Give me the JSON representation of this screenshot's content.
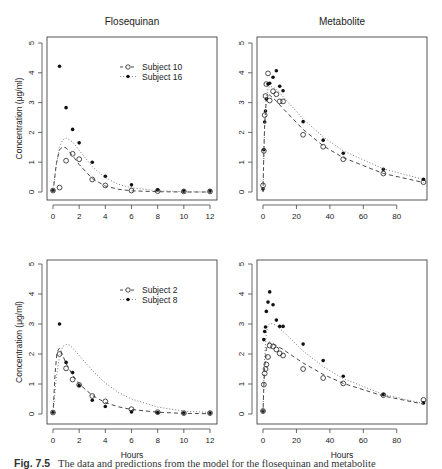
{
  "caption": {
    "label": "Fig. 7.5",
    "text": "The data and predictions from the model for the flosequinan and metabolite"
  },
  "chart_data": [
    {
      "type": "scatter",
      "panel": "top-left",
      "title": "Flosequinan",
      "xlabel": "",
      "ylabel": "Concentration (μg/ml)",
      "xlim": [
        0,
        12
      ],
      "ylim": [
        0,
        5
      ],
      "xticks": [
        0,
        2,
        4,
        6,
        8,
        10,
        12
      ],
      "yticks": [
        0,
        1,
        2,
        3,
        4,
        5
      ],
      "legend": {
        "position": "top-right",
        "entries": [
          {
            "label": "Subject 10",
            "marker": "open-circle",
            "line": "dashed"
          },
          {
            "label": "Subject 16",
            "marker": "filled-dot",
            "line": "dotted"
          }
        ]
      },
      "series": [
        {
          "name": "Subject 10",
          "marker": "open-circle",
          "x": [
            0,
            0.5,
            1,
            1.5,
            2,
            3,
            4,
            6,
            8,
            10,
            12
          ],
          "y": [
            0.05,
            0.15,
            1.05,
            1.28,
            1.1,
            0.42,
            0.22,
            0.05,
            0.03,
            0.02,
            0.02
          ]
        },
        {
          "name": "Subject 16",
          "marker": "filled-dot",
          "x": [
            0,
            0.5,
            1,
            1.5,
            2,
            3,
            4,
            6,
            8,
            10,
            12
          ],
          "y": [
            0.05,
            4.22,
            2.83,
            2.1,
            1.65,
            1.0,
            0.53,
            0.24,
            0.07,
            0.03,
            0.03
          ]
        },
        {
          "name": "Subject 10 fit",
          "line": "dashed",
          "x": [
            0,
            0.25,
            0.5,
            0.75,
            1,
            1.5,
            2,
            3,
            4,
            5,
            6,
            8,
            10,
            12
          ],
          "y": [
            0,
            0.95,
            1.42,
            1.52,
            1.48,
            1.22,
            0.92,
            0.45,
            0.2,
            0.09,
            0.04,
            0.01,
            0.0,
            0.0
          ]
        },
        {
          "name": "Subject 16 fit",
          "line": "dotted",
          "x": [
            0,
            0.25,
            0.5,
            0.75,
            1,
            1.5,
            2,
            3,
            4,
            5,
            6,
            8,
            10,
            12
          ],
          "y": [
            0,
            0.9,
            1.5,
            1.75,
            1.82,
            1.68,
            1.4,
            0.85,
            0.48,
            0.26,
            0.14,
            0.04,
            0.01,
            0.0
          ]
        }
      ]
    },
    {
      "type": "scatter",
      "panel": "top-right",
      "title": "Metabolite",
      "xlabel": "",
      "ylabel": "",
      "xlim": [
        0,
        96
      ],
      "ylim": [
        0,
        5
      ],
      "xticks": [
        0,
        20,
        40,
        60,
        80
      ],
      "yticks": [
        0,
        1,
        2,
        3,
        4,
        5
      ],
      "series": [
        {
          "name": "Subject 10",
          "marker": "open-circle",
          "x": [
            0,
            0.5,
            1,
            1.5,
            2,
            3,
            4,
            6,
            8,
            10,
            12,
            24,
            36,
            48,
            72,
            96
          ],
          "y": [
            0.22,
            1.38,
            2.58,
            3.22,
            3.62,
            3.98,
            3.07,
            3.38,
            3.28,
            3.04,
            3.04,
            1.92,
            1.52,
            1.1,
            0.62,
            0.33
          ]
        },
        {
          "name": "Subject 16",
          "marker": "filled-dot",
          "x": [
            0,
            0.5,
            1,
            1.5,
            2,
            3,
            4,
            6,
            8,
            10,
            12,
            24,
            36,
            48,
            72,
            96
          ],
          "y": [
            0.1,
            1.42,
            2.35,
            2.72,
            3.12,
            3.62,
            3.65,
            3.85,
            4.07,
            3.55,
            3.4,
            2.36,
            1.74,
            1.3,
            0.76,
            0.43
          ]
        },
        {
          "name": "Subject 10 fit",
          "line": "dashed",
          "x": [
            0,
            0.5,
            1,
            2,
            3,
            4,
            6,
            8,
            12,
            24,
            36,
            48,
            72,
            96
          ],
          "y": [
            0,
            1.3,
            2.3,
            3.1,
            3.25,
            3.25,
            3.15,
            3.05,
            2.8,
            2.1,
            1.55,
            1.15,
            0.62,
            0.32
          ]
        },
        {
          "name": "Subject 16 fit",
          "line": "dotted",
          "x": [
            0,
            0.5,
            1,
            2,
            3,
            4,
            6,
            8,
            12,
            24,
            36,
            48,
            72,
            96
          ],
          "y": [
            0,
            1.25,
            2.2,
            3.15,
            3.45,
            3.55,
            3.52,
            3.45,
            3.2,
            2.45,
            1.85,
            1.38,
            0.78,
            0.42
          ]
        }
      ]
    },
    {
      "type": "scatter",
      "panel": "bottom-left",
      "title": "",
      "xlabel": "Hours",
      "ylabel": "Concentration (μg/ml)",
      "xlim": [
        0,
        12
      ],
      "ylim": [
        0,
        5
      ],
      "xticks": [
        0,
        2,
        4,
        6,
        8,
        10,
        12
      ],
      "yticks": [
        0,
        1,
        2,
        3,
        4,
        5
      ],
      "legend": {
        "position": "top-right",
        "entries": [
          {
            "label": "Subject 2",
            "marker": "open-circle",
            "line": "dashed"
          },
          {
            "label": "Subject 8",
            "marker": "filled-dot",
            "line": "dotted"
          }
        ]
      },
      "series": [
        {
          "name": "Subject 2",
          "marker": "open-circle",
          "x": [
            0,
            0.5,
            1,
            1.5,
            2,
            3,
            4,
            6,
            8,
            10,
            12
          ],
          "y": [
            0.05,
            2.0,
            1.52,
            1.15,
            0.97,
            0.6,
            0.42,
            0.16,
            0.06,
            0.03,
            0.03
          ]
        },
        {
          "name": "Subject 8",
          "marker": "filled-dot",
          "x": [
            0,
            0.5,
            1,
            1.5,
            2,
            3,
            4,
            6,
            8,
            10,
            12
          ],
          "y": [
            0.05,
            3.0,
            1.72,
            1.38,
            0.95,
            0.46,
            0.25,
            0.07,
            0.05,
            0.03,
            0.03
          ]
        },
        {
          "name": "Subject 2 fit",
          "line": "dashed",
          "x": [
            0,
            0.15,
            0.3,
            0.5,
            0.75,
            1,
            1.5,
            2,
            3,
            4,
            5,
            6,
            8,
            10,
            12
          ],
          "y": [
            0,
            1.3,
            2.05,
            2.2,
            1.95,
            1.68,
            1.3,
            1.0,
            0.62,
            0.38,
            0.24,
            0.15,
            0.06,
            0.02,
            0.01
          ]
        },
        {
          "name": "Subject 8 fit",
          "line": "dotted",
          "x": [
            0,
            0.25,
            0.5,
            0.75,
            1,
            1.25,
            1.5,
            2,
            3,
            4,
            5,
            6,
            8,
            10,
            12
          ],
          "y": [
            0,
            1.2,
            1.95,
            2.25,
            2.32,
            2.3,
            2.2,
            1.95,
            1.45,
            1.03,
            0.72,
            0.5,
            0.23,
            0.1,
            0.05
          ]
        }
      ]
    },
    {
      "type": "scatter",
      "panel": "bottom-right",
      "title": "",
      "xlabel": "Hours",
      "ylabel": "",
      "xlim": [
        0,
        96
      ],
      "ylim": [
        0,
        5
      ],
      "xticks": [
        0,
        20,
        40,
        60,
        80
      ],
      "yticks": [
        0,
        1,
        2,
        3,
        4,
        5
      ],
      "series": [
        {
          "name": "Subject 2",
          "marker": "open-circle",
          "x": [
            0,
            0.5,
            1,
            1.5,
            2,
            3,
            4,
            6,
            8,
            10,
            12,
            24,
            36,
            48,
            72,
            96
          ],
          "y": [
            0.1,
            0.98,
            1.35,
            1.5,
            1.65,
            1.9,
            2.28,
            2.25,
            2.15,
            2.02,
            1.95,
            1.5,
            1.2,
            1.02,
            0.63,
            0.47
          ]
        },
        {
          "name": "Subject 8",
          "marker": "filled-dot",
          "x": [
            0,
            0.5,
            1,
            1.5,
            2,
            3,
            4,
            6,
            8,
            10,
            12,
            24,
            36,
            48,
            72,
            96
          ],
          "y": [
            0.1,
            2.48,
            2.75,
            2.9,
            3.42,
            3.73,
            4.07,
            3.64,
            3.13,
            2.92,
            2.92,
            2.33,
            1.78,
            1.26,
            0.65,
            0.37
          ]
        },
        {
          "name": "Subject 2 fit",
          "line": "dashed",
          "x": [
            0,
            0.5,
            1,
            2,
            3,
            4,
            6,
            8,
            12,
            24,
            36,
            48,
            72,
            96
          ],
          "y": [
            0,
            0.9,
            1.55,
            2.15,
            2.35,
            2.4,
            2.35,
            2.28,
            2.15,
            1.7,
            1.32,
            1.02,
            0.6,
            0.33
          ]
        },
        {
          "name": "Subject 8 fit",
          "line": "dotted",
          "x": [
            0,
            0.5,
            1,
            2,
            3,
            4,
            6,
            8,
            12,
            24,
            36,
            48,
            72,
            96
          ],
          "y": [
            0,
            1.1,
            1.9,
            2.7,
            2.95,
            3.02,
            3.0,
            2.95,
            2.75,
            2.1,
            1.58,
            1.18,
            0.65,
            0.35
          ]
        }
      ]
    }
  ]
}
